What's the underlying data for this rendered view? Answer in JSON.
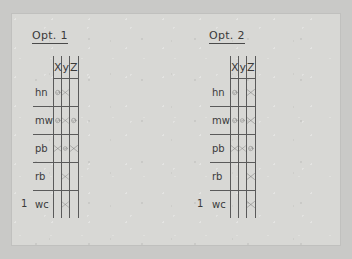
{
  "page": {
    "background_color": "#c9c9c7",
    "card_color": "#d8d8d5",
    "ink_color": "#4d4d4d"
  },
  "panels": [
    {
      "id": "opt-1",
      "title": "Opt. 1",
      "tick_marker": "1",
      "columns": [
        "X",
        "y",
        "Z"
      ],
      "rows": [
        {
          "label": "hn",
          "cells": [
            "check",
            "cross",
            "empty"
          ]
        },
        {
          "label": "mw",
          "cells": [
            "check",
            "cross",
            "check"
          ]
        },
        {
          "label": "pb",
          "cells": [
            "cross",
            "check",
            "cross"
          ]
        },
        {
          "label": "rb",
          "cells": [
            "empty",
            "cross",
            "empty"
          ]
        },
        {
          "label": "wc",
          "cells": [
            "empty",
            "cross",
            "empty"
          ]
        }
      ]
    },
    {
      "id": "opt-2",
      "title": "Opt. 2",
      "tick_marker": "1",
      "columns": [
        "X",
        "y",
        "Z"
      ],
      "rows": [
        {
          "label": "hn",
          "cells": [
            "check",
            "empty",
            "cross"
          ]
        },
        {
          "label": "mw",
          "cells": [
            "check",
            "check",
            "cross"
          ]
        },
        {
          "label": "pb",
          "cells": [
            "cross",
            "cross",
            "check"
          ]
        },
        {
          "label": "rb",
          "cells": [
            "empty",
            "empty",
            "cross"
          ]
        },
        {
          "label": "wc",
          "cells": [
            "empty",
            "empty",
            "cross"
          ]
        }
      ]
    }
  ]
}
